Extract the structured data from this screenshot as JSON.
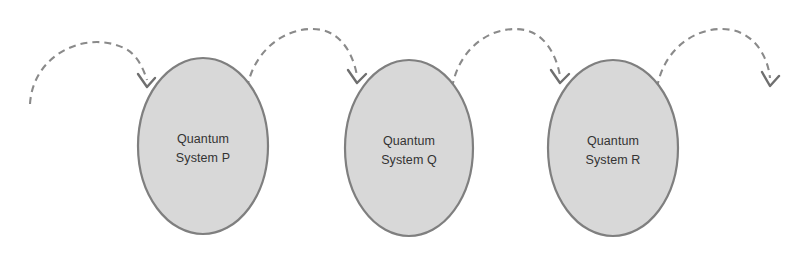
{
  "diagram": {
    "type": "flow-chain",
    "background_color": "#ffffff",
    "node_fill_color": "#d8d8d8",
    "node_stroke_color": "#7f7f7f",
    "arrow_color": "#8a8a8a",
    "text_color": "#333333",
    "nodes": [
      {
        "id": "node-p",
        "shape": "ellipse",
        "label_line1": "Quantum",
        "label_line2": "System P",
        "cx": 203,
        "cy": 146,
        "rx": 65,
        "ry": 88
      },
      {
        "id": "node-q",
        "shape": "ellipse",
        "label_line1": "Quantum",
        "label_line2": "System Q",
        "cx": 409,
        "cy": 148,
        "rx": 64,
        "ry": 88
      },
      {
        "id": "node-r",
        "shape": "ellipse",
        "label_line1": "Quantum",
        "label_line2": "System R",
        "cx": 613,
        "cy": 148,
        "rx": 65,
        "ry": 88
      }
    ],
    "connectors": [
      {
        "id": "arc-in",
        "style": "dashed-arc",
        "from": "external-left",
        "to": "node-p",
        "has_arrowhead": true,
        "arrowhead_at": {
          "x": 147,
          "y": 86
        }
      },
      {
        "id": "arc-p-q",
        "style": "dashed-arc",
        "from": "node-p",
        "to": "node-q",
        "has_arrowhead": true,
        "arrowhead_at": {
          "x": 357,
          "y": 82
        }
      },
      {
        "id": "arc-q-r",
        "style": "dashed-arc",
        "from": "node-q",
        "to": "node-r",
        "has_arrowhead": true,
        "arrowhead_at": {
          "x": 560,
          "y": 82
        }
      },
      {
        "id": "arc-out",
        "style": "dashed-arc",
        "from": "node-r",
        "to": "external-right",
        "has_arrowhead": true,
        "arrowhead_at": {
          "x": 770,
          "y": 84
        }
      }
    ]
  }
}
